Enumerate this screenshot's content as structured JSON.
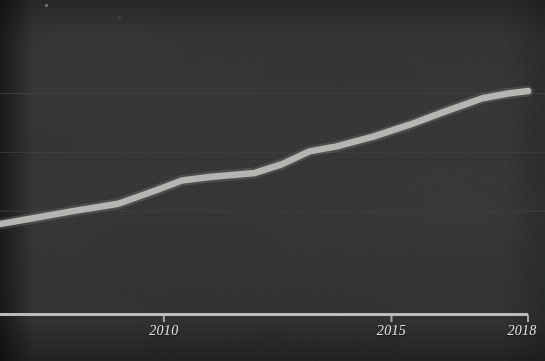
{
  "chart_data": {
    "type": "line",
    "title": "",
    "subtitle": "",
    "xlabel": "",
    "ylabel": "",
    "grid": true,
    "legend": false,
    "legend_position": "none",
    "background_color": "#333537",
    "line_color": "#b9b9b6",
    "axis_color": "#c9c9c7",
    "gridline_color": "#3e4042",
    "label_color": "#e6e6e4",
    "xlim": [
      2006.4,
      2018.0
    ],
    "ylim": [
      0,
      100
    ],
    "xticks": [
      2010,
      2015,
      2018
    ],
    "xtick_labels": [
      "2010",
      "2015",
      "2018"
    ],
    "yticks": [],
    "ytick_labels": [],
    "gridline_values": [
      75,
      55,
      35
    ],
    "annotations": [],
    "series": [
      {
        "name": "series-1",
        "x": [
          2006.4,
          2007.0,
          2008.0,
          2009.0,
          2009.8,
          2010.4,
          2011.0,
          2012.0,
          2012.6,
          2013.2,
          2013.8,
          2014.6,
          2015.4,
          2016.2,
          2017.0,
          2017.6,
          2018.0
        ],
        "values": [
          30.6,
          32.2,
          35.0,
          37.5,
          41.9,
          45.4,
          46.6,
          48.0,
          51.0,
          55.3,
          57.0,
          60.3,
          64.4,
          69.0,
          73.4,
          75.1,
          75.8
        ]
      }
    ]
  },
  "axis": {
    "tick_labels": [
      {
        "text": "2010",
        "x": 181
      },
      {
        "text": "2015",
        "x": 397
      },
      {
        "text": "2018",
        "x": 522
      }
    ]
  },
  "colors": {
    "background": "#333537",
    "line": "#b9b9b6",
    "axis": "#c9c9c7",
    "grid": "#3e4042",
    "text": "#e6e6e4"
  }
}
